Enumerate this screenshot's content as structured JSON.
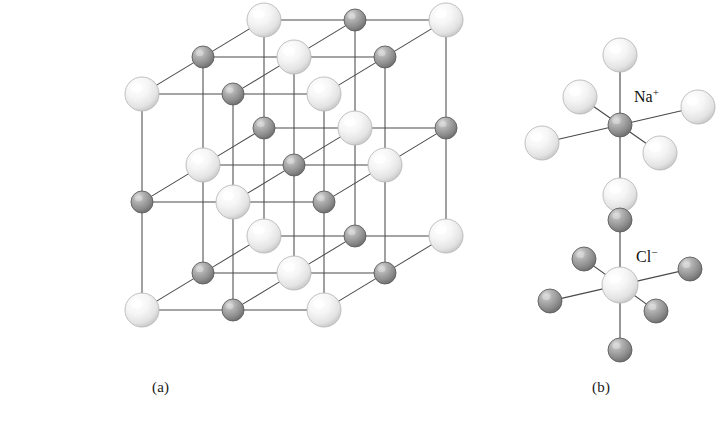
{
  "figure": {
    "background_color": "#ffffff",
    "panels": [
      {
        "id": "a",
        "caption": "(a)",
        "description": "Rock-salt cubic lattice of alternating sodium and chloride ions"
      },
      {
        "id": "b",
        "caption": "(b)",
        "description": "Octahedral coordination environments of each ion"
      }
    ]
  },
  "captions": {
    "panel_a": "(a)",
    "panel_b": "(b)"
  },
  "labels": {
    "sodium": {
      "element": "Na",
      "charge": "+",
      "text": "Na+"
    },
    "chloride": {
      "element": "Cl",
      "charge": "−",
      "text": "Cl−"
    }
  },
  "colors": {
    "sphere_light_fill": "#f7f7f7",
    "sphere_light_edge": "#b9b9b9",
    "sphere_light_highlight": "#ffffff",
    "sphere_dark_fill": "#9a9a9a",
    "sphere_dark_edge": "#5e5e5e",
    "sphere_dark_highlight": "#d8d8d8",
    "bond_color": "#4a4a4a",
    "text_color": "#111111",
    "background": "#ffffff"
  },
  "chart_data": {
    "type": "diagram",
    "panel_a": {
      "lattice": "rock-salt (face-centered cubic, NaCl type)",
      "grid": [
        3,
        3,
        3
      ],
      "site_count": 27,
      "light_sphere_count": 14,
      "dark_sphere_count": 13,
      "light_radius_px": 17,
      "dark_radius_px": 11,
      "origin_px": [
        142,
        310
      ],
      "axis_x_px": [
        91,
        0
      ],
      "axis_y_px": [
        0,
        -108
      ],
      "axis_z_px": [
        61,
        -37
      ],
      "coloring_rule": "light sphere when (i+j+k) is even, dark sphere when (i+j+k) is odd"
    },
    "panel_b": {
      "units": [
        {
          "name": "sodium-octahedron",
          "label": "Na+",
          "center_px": [
            620,
            125
          ],
          "center_kind": "dark",
          "center_radius_px": 12,
          "neighbor_kind": "light",
          "neighbor_radius_px": 17,
          "neighbor_count": 6,
          "coordination": 6,
          "neighbor_offsets_px": [
            [
              0,
              -70
            ],
            [
              0,
              70
            ],
            [
              -78,
              18
            ],
            [
              78,
              -18
            ],
            [
              -40,
              -28
            ],
            [
              40,
              28
            ]
          ]
        },
        {
          "name": "chloride-octahedron",
          "label": "Cl−",
          "center_px": [
            620,
            285
          ],
          "center_kind": "light",
          "center_radius_px": 18,
          "neighbor_kind": "dark",
          "neighbor_radius_px": 12,
          "neighbor_count": 6,
          "coordination": 6,
          "neighbor_offsets_px": [
            [
              0,
              -65
            ],
            [
              0,
              65
            ],
            [
              -70,
              16
            ],
            [
              70,
              -16
            ],
            [
              -36,
              -26
            ],
            [
              36,
              26
            ]
          ]
        }
      ]
    }
  }
}
